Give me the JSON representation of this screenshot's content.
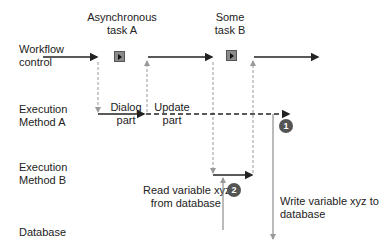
{
  "lanes": {
    "workflow": [
      "Workflow",
      "control"
    ],
    "method_a": [
      "Execution",
      "Method A"
    ],
    "method_b": [
      "Execution",
      "Method B"
    ],
    "database": "Database"
  },
  "tasks": {
    "a": [
      "Asynchronous",
      "task A"
    ],
    "b": [
      "Some",
      "task B"
    ]
  },
  "segments": {
    "dialog": [
      "Dialog",
      "part"
    ],
    "update": [
      "Update",
      "part"
    ]
  },
  "annotations": {
    "read": [
      "Read variable xyz",
      "from database"
    ],
    "write": [
      "Write variable xyz to",
      "database"
    ]
  },
  "badges": {
    "one": "1",
    "two": "2"
  },
  "colors": {
    "solid": "#222222",
    "dashed_grey": "#999999",
    "badge": "#555555"
  }
}
